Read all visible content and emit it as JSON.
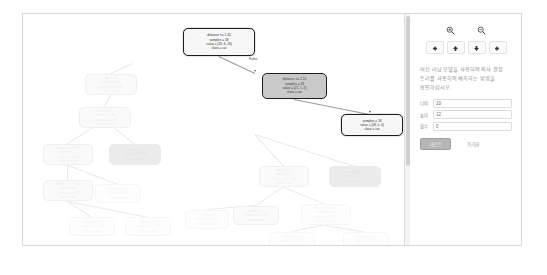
{
  "window": {
    "title": "Decision Tree Visualizer"
  },
  "toolbar": {
    "zoom_in": {
      "icon": "zoom-in-icon",
      "label": ""
    },
    "zoom_out": {
      "icon": "zoom-out-icon",
      "label": ""
    },
    "nav": [
      {
        "icon": "arrow-left-icon",
        "glyph": "←",
        "name": "pan-left-button"
      },
      {
        "icon": "arrow-up-icon",
        "glyph": "↑",
        "name": "pan-up-button"
      },
      {
        "icon": "arrow-down-icon",
        "glyph": "↓",
        "name": "pan-down-button"
      },
      {
        "icon": "arrow-right-icon",
        "glyph": "→",
        "name": "pan-right-button"
      }
    ]
  },
  "panel": {
    "help_text": "머신 러닝 모델을 사용하여 의사 결정 트리를 사용하여 예측하는 방법을 확인하십시오.",
    "fields": [
      {
        "label": "너비",
        "value": "10",
        "name": "width-field"
      },
      {
        "label": "높이",
        "value": "12",
        "name": "height-field"
      },
      {
        "label": "횟수",
        "value": "0",
        "name": "count-field"
      }
    ],
    "buttons": {
      "primary": "테스트",
      "secondary": "초기화"
    }
  },
  "tree": {
    "edge_labels": [
      {
        "text": "False"
      }
    ],
    "active_nodes": [
      {
        "id": "root",
        "lines": [
          "distance <= 1.45",
          "samples = 58",
          "value = [26, 6, 26]",
          "class = car"
        ],
        "style": "active"
      },
      {
        "id": "n2",
        "lines": [
          "distance <= 2.15",
          "samples = 24",
          "value = [21, 1, 2]",
          "class = car"
        ],
        "style": "active-grey"
      },
      {
        "id": "leaf",
        "lines": [
          "samples = 18",
          "value = [18, 0, 0]",
          "class = car"
        ],
        "style": "active"
      }
    ],
    "ghost_nodes": [
      {
        "lines": [
          "age <= 0.5",
          "samples = 34",
          "value = [5, 5, 24]",
          "class = truck"
        ],
        "style": "ghost",
        "x": 62,
        "y": 60,
        "w": 52,
        "h": 21
      },
      {
        "lines": [
          "speed <= 1.1",
          "samples = 34",
          "value = [5, 5, 24]",
          "class = truck"
        ],
        "style": "ghost",
        "x": 56,
        "y": 93,
        "w": 52,
        "h": 21
      },
      {
        "lines": [
          "distance <= 0.85",
          "samples = 7",
          "value = [4, 3, 0]",
          "class = truck"
        ],
        "style": "ghost",
        "x": 20,
        "y": 130,
        "w": 50,
        "h": 21
      },
      {
        "lines": [
          "samples = 27",
          "value = [1, 2, 24]",
          "class = truck"
        ],
        "style": "ghost-fill",
        "x": 86,
        "y": 130,
        "w": 52,
        "h": 21
      },
      {
        "lines": [
          "distance <= 1.35",
          "samples = 4",
          "value = [1, 3, 0]",
          "class = bus"
        ],
        "style": "ghost",
        "x": 20,
        "y": 166,
        "w": 50,
        "h": 21
      },
      {
        "lines": [
          "samples = 3",
          "value = [3, 0, 0]",
          "class = car"
        ],
        "style": "ghost-faint",
        "x": 72,
        "y": 170,
        "w": 46,
        "h": 19
      },
      {
        "lines": [
          "samples = 1",
          "value = [1, 0, 0]",
          "class = car"
        ],
        "style": "ghost-faint",
        "x": 46,
        "y": 203,
        "w": 46,
        "h": 19
      },
      {
        "lines": [
          "samples = 3",
          "value = [0, 3, 0]",
          "class = bus"
        ],
        "style": "ghost-faint",
        "x": 102,
        "y": 203,
        "w": 46,
        "h": 19
      },
      {
        "lines": [
          "age <= 0.5",
          "samples = 6",
          "value = [3, 1, 2]",
          "class = car"
        ],
        "style": "ghost",
        "x": 236,
        "y": 152,
        "w": 50,
        "h": 21
      },
      {
        "lines": [
          "samples = 4",
          "value = [3, 0, 1]",
          "class = car"
        ],
        "style": "ghost-fill",
        "x": 306,
        "y": 152,
        "w": 52,
        "h": 21
      },
      {
        "lines": [
          "samples = 2",
          "value = [0, 1, 1]",
          "class = bus"
        ],
        "style": "ghost",
        "x": 210,
        "y": 192,
        "w": 46,
        "h": 19
      },
      {
        "lines": [
          "distance <= 1.75",
          "samples = 4",
          "value = [1, 1, 2]",
          "class = truck"
        ],
        "style": "ghost-faint",
        "x": 278,
        "y": 190,
        "w": 50,
        "h": 21
      },
      {
        "lines": [
          "samples = 2",
          "value = [1, 1, 0]",
          "class = car"
        ],
        "style": "ghost-faint",
        "x": 162,
        "y": 196,
        "w": 44,
        "h": 19
      },
      {
        "lines": [
          "samples = 2",
          "value = [0, 0, 2]",
          "class = truck"
        ],
        "style": "ghost-faint",
        "x": 246,
        "y": 218,
        "w": 46,
        "h": 19
      },
      {
        "lines": [
          "samples = 2",
          "value = [1, 0, 1]",
          "class = car"
        ],
        "style": "ghost-faint",
        "x": 320,
        "y": 218,
        "w": 46,
        "h": 19
      }
    ]
  }
}
